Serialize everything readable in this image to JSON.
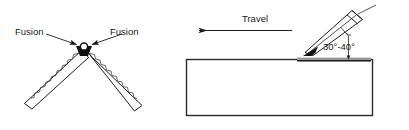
{
  "figure": {
    "width": 409,
    "height": 130,
    "background_color": "#ffffff",
    "line_color": "#1d1d1d",
    "text_color": "#1a1a1a"
  },
  "left_panel": {
    "name": "fusion-joint-diagram",
    "description": "Two plates meeting at a V vertex with fusion arrows",
    "labels": {
      "fusion_left": "Fusion",
      "fusion_right": "Fusion"
    },
    "annotations": [
      {
        "label": "Fusion",
        "side": "left",
        "points_to": "joint-vertex"
      },
      {
        "label": "Fusion",
        "side": "right",
        "points_to": "joint-vertex"
      }
    ]
  },
  "right_panel": {
    "name": "travel-angle-diagram",
    "description": "Electrode held at an angle to a workpiece with travel direction",
    "labels": {
      "travel": "Travel",
      "angle": "30°-40°"
    },
    "angle_range": {
      "min_degrees": 30,
      "max_degrees": 40,
      "display": "30°-40°"
    },
    "travel_direction": "left",
    "icon_names": {
      "travel_arrow": "arrow-left-icon",
      "electrode": "electrode-torch-icon",
      "weld_bead": "weld-bead-icon"
    }
  }
}
